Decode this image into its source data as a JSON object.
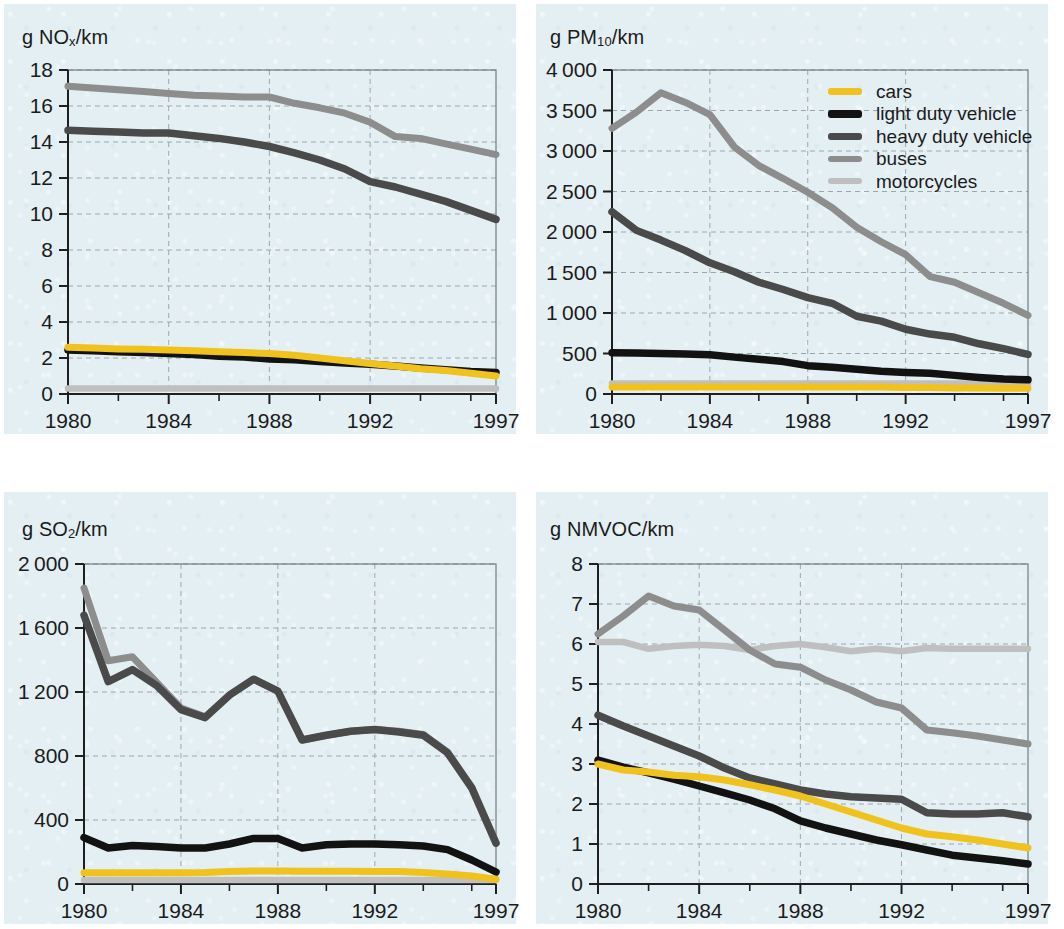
{
  "figure": {
    "background_color": "#ffffff",
    "panel_color": "#e4eff3"
  },
  "legend": {
    "position": "top-right of PM10 panel",
    "items": [
      {
        "label": "cars",
        "color": "#efc21e",
        "key": "cars"
      },
      {
        "label": "light duty vehicle",
        "color": "#121212",
        "key": "light"
      },
      {
        "label": "heavy duty vehicle",
        "color": "#4a4a4a",
        "key": "heavy"
      },
      {
        "label": "buses",
        "color": "#8d8d8d",
        "key": "buses"
      },
      {
        "label": "motorcycles",
        "color": "#bfbfbf",
        "key": "motorcycles"
      }
    ]
  },
  "chart_data": [
    {
      "id": "nox",
      "type": "line",
      "title": "g NOx/km",
      "title_base": "g NO",
      "title_sub": "x",
      "title_tail": "/km",
      "xlabel": "",
      "ylabel": "g NOx/km",
      "grid": true,
      "xlim": [
        1980,
        1997
      ],
      "ylim": [
        0,
        18
      ],
      "yticks": [
        0,
        2,
        4,
        6,
        8,
        10,
        12,
        14,
        16,
        18
      ],
      "ytick_labels": [
        "0",
        "2",
        "4",
        "6",
        "8",
        "10",
        "12",
        "14",
        "16",
        "18"
      ],
      "xticks": [
        1980,
        1984,
        1988,
        1992,
        1997
      ],
      "xtick_labels": [
        "1980",
        "1984",
        "1988",
        "1992",
        "1997"
      ],
      "x": [
        1980,
        1981,
        1982,
        1983,
        1984,
        1985,
        1986,
        1987,
        1988,
        1989,
        1990,
        1991,
        1992,
        1993,
        1994,
        1995,
        1996,
        1997
      ],
      "series": [
        {
          "name": "cars",
          "color": "#efc21e",
          "values": [
            2.6,
            2.55,
            2.5,
            2.48,
            2.45,
            2.4,
            2.35,
            2.3,
            2.25,
            2.15,
            2.0,
            1.85,
            1.7,
            1.55,
            1.4,
            1.3,
            1.15,
            1.0
          ]
        },
        {
          "name": "light duty vehicle",
          "color": "#121212",
          "values": [
            2.45,
            2.4,
            2.35,
            2.3,
            2.25,
            2.2,
            2.1,
            2.05,
            1.95,
            1.9,
            1.8,
            1.72,
            1.65,
            1.55,
            1.45,
            1.35,
            1.25,
            1.2
          ]
        },
        {
          "name": "heavy duty vehicle",
          "color": "#4a4a4a",
          "values": [
            14.65,
            14.6,
            14.55,
            14.5,
            14.5,
            14.35,
            14.2,
            14.0,
            13.75,
            13.4,
            13.0,
            12.5,
            11.8,
            11.5,
            11.1,
            10.7,
            10.2,
            9.7
          ]
        },
        {
          "name": "buses",
          "color": "#8d8d8d",
          "values": [
            17.1,
            17.0,
            16.9,
            16.8,
            16.7,
            16.6,
            16.55,
            16.5,
            16.5,
            16.15,
            15.9,
            15.6,
            15.1,
            14.3,
            14.2,
            13.9,
            13.6,
            13.3
          ]
        },
        {
          "name": "motorcycles",
          "color": "#bfbfbf",
          "values": [
            0.3,
            0.3,
            0.3,
            0.3,
            0.3,
            0.3,
            0.3,
            0.3,
            0.3,
            0.3,
            0.3,
            0.3,
            0.3,
            0.3,
            0.3,
            0.3,
            0.3,
            0.3
          ]
        }
      ]
    },
    {
      "id": "pm10",
      "type": "line",
      "title": "g PM10/km",
      "title_base": "g PM",
      "title_sub": "10",
      "title_tail": "/km",
      "xlabel": "",
      "ylabel": "g PM10/km",
      "grid": true,
      "xlim": [
        1980,
        1997
      ],
      "ylim": [
        0,
        4000
      ],
      "yticks": [
        0,
        500,
        1000,
        1500,
        2000,
        2500,
        3000,
        3500,
        4000
      ],
      "ytick_labels": [
        "0",
        "500",
        "1 000",
        "1 500",
        "2 000",
        "2 500",
        "3 000",
        "3 500",
        "4 000"
      ],
      "xticks": [
        1980,
        1984,
        1988,
        1992,
        1997
      ],
      "xtick_labels": [
        "1980",
        "1984",
        "1988",
        "1992",
        "1997"
      ],
      "x": [
        1980,
        1981,
        1982,
        1983,
        1984,
        1985,
        1986,
        1987,
        1988,
        1989,
        1990,
        1991,
        1992,
        1993,
        1994,
        1995,
        1996,
        1997
      ],
      "series": [
        {
          "name": "cars",
          "color": "#efc21e",
          "values": [
            85,
            85,
            85,
            85,
            85,
            85,
            85,
            85,
            85,
            85,
            85,
            85,
            80,
            80,
            75,
            75,
            70,
            70
          ]
        },
        {
          "name": "light duty vehicle",
          "color": "#121212",
          "values": [
            510,
            505,
            500,
            495,
            485,
            455,
            430,
            400,
            350,
            330,
            305,
            280,
            265,
            255,
            230,
            205,
            185,
            175
          ]
        },
        {
          "name": "heavy duty vehicle",
          "color": "#4a4a4a",
          "values": [
            2250,
            2020,
            1900,
            1770,
            1620,
            1510,
            1380,
            1290,
            1190,
            1120,
            960,
            900,
            800,
            740,
            700,
            620,
            560,
            490
          ]
        },
        {
          "name": "buses",
          "color": "#8d8d8d",
          "values": [
            3280,
            3480,
            3720,
            3600,
            3450,
            3050,
            2820,
            2660,
            2490,
            2300,
            2060,
            1880,
            1720,
            1450,
            1380,
            1250,
            1120,
            970
          ]
        },
        {
          "name": "motorcycles",
          "color": "#bfbfbf",
          "values": [
            130,
            130,
            130,
            130,
            130,
            130,
            130,
            130,
            130,
            130,
            130,
            130,
            130,
            130,
            130,
            130,
            130,
            130
          ]
        }
      ]
    },
    {
      "id": "so2",
      "type": "line",
      "title": "g SO2/km",
      "title_base": "g SO",
      "title_sub": "2",
      "title_tail": "/km",
      "xlabel": "",
      "ylabel": "g SO2/km",
      "grid": true,
      "xlim": [
        1980,
        1997
      ],
      "ylim": [
        0,
        2000
      ],
      "yticks": [
        0,
        400,
        800,
        1200,
        1600,
        2000
      ],
      "ytick_labels": [
        "0",
        "400",
        "800",
        "1 200",
        "1 600",
        "2 000"
      ],
      "xticks": [
        1980,
        1984,
        1988,
        1992,
        1997
      ],
      "xtick_labels": [
        "1980",
        "1984",
        "1988",
        "1992",
        "1997"
      ],
      "x": [
        1980,
        1981,
        1982,
        1983,
        1984,
        1985,
        1986,
        1987,
        1988,
        1989,
        1990,
        1991,
        1992,
        1993,
        1994,
        1995,
        1996,
        1997
      ],
      "series": [
        {
          "name": "cars",
          "color": "#efc21e",
          "values": [
            70,
            70,
            70,
            70,
            70,
            72,
            78,
            82,
            82,
            80,
            80,
            80,
            78,
            78,
            72,
            62,
            50,
            30
          ]
        },
        {
          "name": "light duty vehicle",
          "color": "#121212",
          "values": [
            290,
            225,
            240,
            235,
            225,
            225,
            250,
            285,
            285,
            225,
            245,
            250,
            250,
            245,
            238,
            215,
            150,
            75
          ]
        },
        {
          "name": "heavy duty vehicle",
          "color": "#4a4a4a",
          "values": [
            1680,
            1265,
            1340,
            1240,
            1090,
            1040,
            1180,
            1280,
            1205,
            900,
            930,
            955,
            965,
            950,
            930,
            820,
            600,
            255
          ]
        },
        {
          "name": "buses",
          "color": "#8d8d8d",
          "values": [
            1850,
            1395,
            1420,
            1260,
            1100,
            1045,
            1180,
            1280,
            1205,
            900,
            930,
            955,
            965,
            955,
            935,
            825,
            605,
            260
          ]
        },
        {
          "name": "motorcycles",
          "color": "#bfbfbf",
          "values": [
            25,
            25,
            25,
            25,
            25,
            25,
            25,
            25,
            25,
            25,
            25,
            25,
            25,
            25,
            25,
            25,
            25,
            25
          ]
        }
      ]
    },
    {
      "id": "nmvoc",
      "type": "line",
      "title": "g NMVOC/km",
      "title_base": "g NMVOC/km",
      "title_sub": "",
      "title_tail": "",
      "xlabel": "",
      "ylabel": "g NMVOC/km",
      "grid": true,
      "xlim": [
        1980,
        1997
      ],
      "ylim": [
        0,
        8
      ],
      "yticks": [
        0,
        1,
        2,
        3,
        4,
        5,
        6,
        7,
        8
      ],
      "ytick_labels": [
        "0",
        "1",
        "2",
        "3",
        "4",
        "5",
        "6",
        "7",
        "8"
      ],
      "xticks": [
        1980,
        1984,
        1988,
        1992,
        1997
      ],
      "xtick_labels": [
        "1980",
        "1984",
        "1988",
        "1992",
        "1997"
      ],
      "x": [
        1980,
        1981,
        1982,
        1983,
        1984,
        1985,
        1986,
        1987,
        1988,
        1989,
        1990,
        1991,
        1992,
        1993,
        1994,
        1995,
        1996,
        1997
      ],
      "series": [
        {
          "name": "cars",
          "color": "#efc21e",
          "values": [
            3.0,
            2.85,
            2.8,
            2.72,
            2.68,
            2.6,
            2.48,
            2.35,
            2.2,
            2.0,
            1.8,
            1.6,
            1.4,
            1.25,
            1.18,
            1.1,
            1.0,
            0.9
          ]
        },
        {
          "name": "light duty vehicle",
          "color": "#121212",
          "values": [
            3.1,
            2.92,
            2.78,
            2.62,
            2.45,
            2.28,
            2.1,
            1.88,
            1.58,
            1.4,
            1.25,
            1.1,
            0.98,
            0.85,
            0.72,
            0.65,
            0.58,
            0.5
          ]
        },
        {
          "name": "heavy duty vehicle",
          "color": "#4a4a4a",
          "values": [
            4.22,
            3.95,
            3.7,
            3.45,
            3.2,
            2.9,
            2.65,
            2.5,
            2.35,
            2.25,
            2.18,
            2.15,
            2.12,
            1.78,
            1.75,
            1.75,
            1.78,
            1.68
          ]
        },
        {
          "name": "buses",
          "color": "#8d8d8d",
          "values": [
            6.25,
            6.7,
            7.2,
            6.95,
            6.85,
            6.35,
            5.85,
            5.5,
            5.42,
            5.1,
            4.85,
            4.55,
            4.4,
            3.85,
            3.78,
            3.7,
            3.6,
            3.5
          ]
        },
        {
          "name": "motorcycles",
          "color": "#bfbfbf",
          "values": [
            6.05,
            6.05,
            5.88,
            5.95,
            5.98,
            5.95,
            5.85,
            5.95,
            6.0,
            5.92,
            5.82,
            5.88,
            5.82,
            5.9,
            5.88,
            5.88,
            5.88,
            5.88
          ]
        }
      ]
    }
  ]
}
